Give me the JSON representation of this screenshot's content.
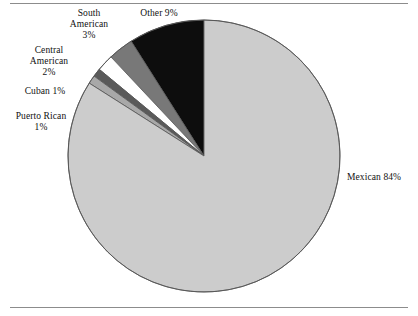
{
  "chart_data": {
    "type": "pie",
    "title": "",
    "subtitle": "",
    "xlabel": "",
    "ylabel": "",
    "legend_position": "none",
    "grid": false,
    "start_angle_deg": 0,
    "direction": "counterclockwise",
    "categories": [
      "Other",
      "South American",
      "Central American",
      "Cuban",
      "Puerto Rican",
      "Mexican"
    ],
    "values": [
      9,
      3,
      2,
      1,
      1,
      84
    ],
    "units": "percent",
    "slices": [
      {
        "name": "Other",
        "value": 9,
        "value_label": "9%",
        "color": "#0d0d0d"
      },
      {
        "name": "South American",
        "value": 3,
        "value_label": "3%",
        "color": "#787878"
      },
      {
        "name": "Central American",
        "value": 2,
        "value_label": "2%",
        "color": "#ffffff"
      },
      {
        "name": "Cuban",
        "value": 1,
        "value_label": "1%",
        "color": "#5a5a5a"
      },
      {
        "name": "Puerto Rican",
        "value": 1,
        "value_label": "1%",
        "color": "#a8a8a8"
      },
      {
        "name": "Mexican",
        "value": 84,
        "value_label": "84%",
        "color": "#cccccc"
      }
    ]
  },
  "labels": {
    "south_american": {
      "line1": "South",
      "line2": "American",
      "line3": "3%"
    },
    "other": {
      "line1": "Other 9%"
    },
    "central_american": {
      "line1": "Central",
      "line2": "American",
      "line3": "2%"
    },
    "cuban": {
      "line1": "Cuban 1%"
    },
    "puerto_rican": {
      "line1": "Puerto Rican",
      "line2": "1%"
    },
    "mexican": {
      "line1": "Mexican 84%"
    }
  },
  "style": {
    "slice_outline": "#555555",
    "rule_color": "#8c8c8c",
    "background": "#ffffff"
  }
}
